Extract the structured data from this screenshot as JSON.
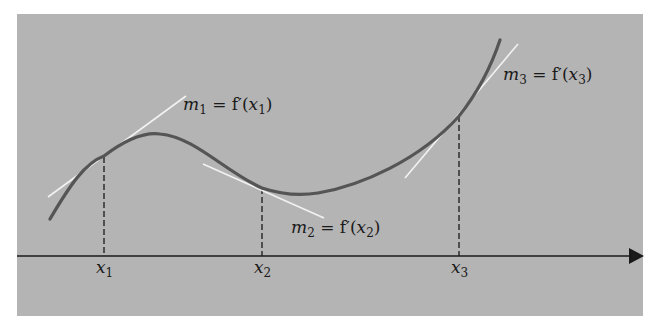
{
  "diagram": {
    "title": "",
    "colors": {
      "background": "#ffffff",
      "panel": "#b4b4b4",
      "curve": "#555555",
      "tangent": "#f2f2f2",
      "axis": "#1a1a1a"
    },
    "axis": {
      "arrow": true
    },
    "points": [
      {
        "id": "x1",
        "label": "x",
        "sub": "1"
      },
      {
        "id": "x2",
        "label": "x",
        "sub": "2"
      },
      {
        "id": "x3",
        "label": "x",
        "sub": "3"
      }
    ],
    "tangent_labels": [
      {
        "m": "m",
        "sub": "1",
        "eq": " = f′(",
        "x": "x",
        "xsub": "1",
        "close": ")"
      },
      {
        "m": "m",
        "sub": "2",
        "eq": " = f′(",
        "x": "x",
        "xsub": "2",
        "close": ")"
      },
      {
        "m": "m",
        "sub": "3",
        "eq": " = f′(",
        "x": "x",
        "xsub": "3",
        "close": ")"
      }
    ]
  }
}
